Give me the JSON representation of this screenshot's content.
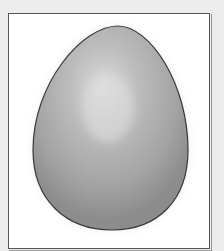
{
  "image": {
    "subject": "egg",
    "description": "Gray shaded egg illustration inside a white bordered frame",
    "colors": {
      "background": "#ececec",
      "frame_fill": "#ffffff",
      "frame_border": "#555555",
      "egg_highlight": "#d8d8d8",
      "egg_mid": "#a8a8a8",
      "egg_shadow": "#8a8a8a",
      "egg_outline": "#3a3a3a"
    }
  }
}
